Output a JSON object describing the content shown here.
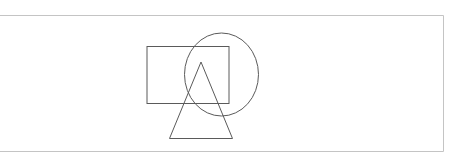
{
  "canvas": {
    "width": 465,
    "height": 156,
    "background": "#ffffff"
  },
  "frame": {
    "stroke": "#c4c4c4",
    "top": {
      "x1": 0,
      "y1": 15.5,
      "x2": 443.5,
      "y2": 15.5
    },
    "right": {
      "x1": 443.5,
      "y1": 15.5,
      "x2": 443.5,
      "y2": 151.5
    },
    "bottom": {
      "x1": 0,
      "y1": 151.5,
      "x2": 443.5,
      "y2": 151.5
    }
  },
  "shapes": {
    "stroke": "#5a5a5a",
    "stroke_width": 1,
    "rectangle": {
      "x": 147,
      "y": 46.5,
      "width": 82,
      "height": 57
    },
    "ellipse": {
      "cx": 221.5,
      "cy": 74.5,
      "rx": 37,
      "ry": 41.5
    },
    "triangle": {
      "points": "201,62 169.5,138.5 232.5,138.5"
    }
  }
}
